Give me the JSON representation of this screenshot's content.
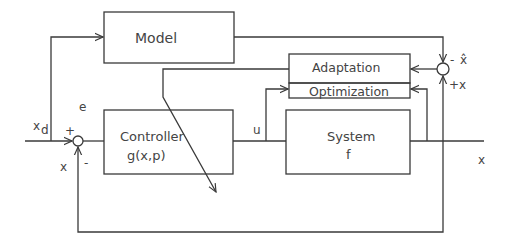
{
  "diagram": {
    "blocks": {
      "model": {
        "label": "Model"
      },
      "adaptation": {
        "label": "Adaptation"
      },
      "optimization": {
        "label": "Optimization"
      },
      "controller": {
        "label_line1": "Controller",
        "label_line2": "g(x,p)"
      },
      "system": {
        "label_line1": "System",
        "label_line2": "f"
      }
    },
    "signals": {
      "reference": "x",
      "reference_sub": "d",
      "error": "e",
      "control": "u",
      "output": "x",
      "feedback": "x",
      "model_output": "x̂",
      "plant_output_to_compare": "x"
    },
    "signs": {
      "left_plus": "+",
      "left_minus": "-",
      "right_minus": "-",
      "right_plus": "+"
    },
    "colors": {
      "line": "#3a3a3a",
      "text": "#444444",
      "background": "#ffffff"
    }
  }
}
